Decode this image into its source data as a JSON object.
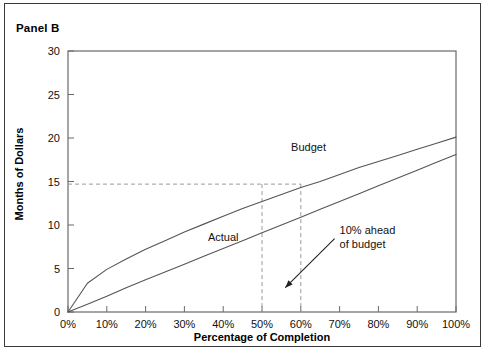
{
  "panel": {
    "title": "Panel B"
  },
  "chart_data": {
    "type": "line",
    "title": "Panel B",
    "xlabel": "Percentage of Completion",
    "ylabel": "Months of Dollars",
    "xlim": [
      0,
      100
    ],
    "ylim": [
      0,
      30
    ],
    "grid": false,
    "legend_position": "inline-labels",
    "x_tick_labels": [
      "0%",
      "10%",
      "20%",
      "30%",
      "40%",
      "50%",
      "60%",
      "70%",
      "80%",
      "90%",
      "100%"
    ],
    "x_ticks": [
      0,
      10,
      20,
      30,
      40,
      50,
      60,
      70,
      80,
      90,
      100
    ],
    "y_tick_labels": [
      "0",
      "5",
      "10",
      "15",
      "20",
      "25",
      "30"
    ],
    "y_ticks": [
      0,
      5,
      10,
      15,
      20,
      25,
      30
    ],
    "x": [
      0,
      5,
      10,
      15,
      20,
      25,
      30,
      35,
      40,
      45,
      50,
      55,
      60,
      65,
      70,
      75,
      80,
      85,
      90,
      95,
      100
    ],
    "series": [
      {
        "name": "Budget",
        "label": "Budget",
        "color": "#555555",
        "style": "solid",
        "values": [
          0,
          3.3,
          4.9,
          6.1,
          7.2,
          8.2,
          9.2,
          10.1,
          11.0,
          11.9,
          12.7,
          13.5,
          14.3,
          15.0,
          15.8,
          16.6,
          17.3,
          18.0,
          18.7,
          19.4,
          20.1
        ]
      },
      {
        "name": "Actual",
        "label": "Actual",
        "color": "#555555",
        "style": "solid",
        "values": [
          0,
          0.9,
          1.8,
          2.8,
          3.7,
          4.6,
          5.5,
          6.4,
          7.3,
          8.2,
          9.1,
          10.0,
          10.9,
          11.8,
          12.7,
          13.6,
          14.5,
          15.4,
          16.3,
          17.2,
          18.1
        ]
      }
    ],
    "annotations": [
      {
        "name": "budget-series-label",
        "text": "Budget",
        "x": 62,
        "y": 18.5
      },
      {
        "name": "actual-series-label",
        "text": "Actual",
        "x": 40,
        "y": 8.2
      },
      {
        "name": "variance-callout",
        "text_line1": "10% ahead",
        "text_line2": "of budget",
        "x": 70,
        "y": 9.0,
        "arrow_to_x": 56,
        "arrow_to_y": 2.8
      }
    ],
    "reference_lines": [
      {
        "name": "horizontal-guide",
        "orientation": "horizontal",
        "value": 14.7,
        "style": "dashed"
      },
      {
        "name": "vertical-guide-budget",
        "orientation": "vertical",
        "value": 50,
        "style": "dashed"
      },
      {
        "name": "vertical-guide-actual",
        "orientation": "vertical",
        "value": 60,
        "style": "dashed"
      }
    ]
  }
}
